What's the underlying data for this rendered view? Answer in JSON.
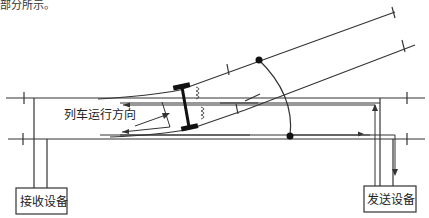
{
  "caption": {
    "text": "部分所示。"
  },
  "labels": {
    "train_direction": "列车运行方向",
    "receiver": "接收设备",
    "transmitter": "发送设备"
  },
  "colors": {
    "line": "#333333",
    "background": "#ffffff"
  }
}
